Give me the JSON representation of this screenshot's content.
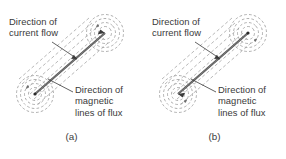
{
  "figure": {
    "background_color": "#ffffff",
    "ink_color": "#3a3a3a",
    "flux_line_color": "#9a9a9a",
    "conductor_color": "#555555"
  },
  "panels": [
    {
      "id": "a",
      "caption": "(a)",
      "current_label": "Direction of\ncurrent flow",
      "flux_label": "Direction of\nmagnetic\nlines of flux",
      "current_direction": "up-right",
      "flux_rings_per_end": 4,
      "conductor_angle_deg": -41
    },
    {
      "id": "b",
      "caption": "(b)",
      "current_label": "Direction of\ncurrent flow",
      "flux_label": "Direction of\nmagnetic\nlines of flux",
      "current_direction": "down-left",
      "flux_rings_per_end": 4,
      "conductor_angle_deg": -41
    }
  ]
}
